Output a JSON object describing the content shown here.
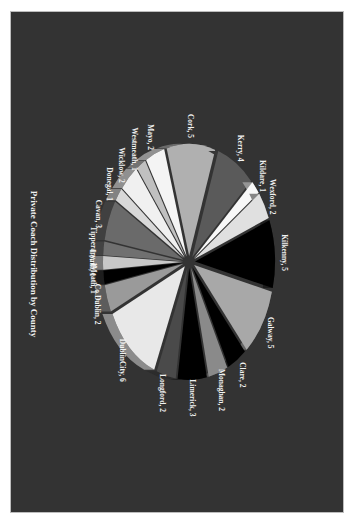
{
  "chart_data": {
    "type": "pie",
    "variant": "exploded 3D pie, rotated 90 degrees",
    "title": "Private Coach Distribution by County",
    "categories": [
      "Kilkenny",
      "Galway",
      "Clare",
      "Monaghan",
      "Limerick",
      "Longford",
      "DublinCity",
      "Co.Dublin",
      "Meath",
      "Louth",
      "Tipperary",
      "Cavan",
      "Donegal",
      "Wicklow",
      "Westmeath",
      "Mayo",
      "Cork",
      "Kerry",
      "Kildare",
      "Wexford"
    ],
    "values": [
      5,
      5,
      2,
      2,
      3,
      2,
      6,
      2,
      1,
      1,
      1,
      3,
      1,
      2,
      1,
      2,
      5,
      4,
      1,
      2
    ],
    "labels": [
      "Kilkenny, 5",
      "Galway, 5",
      "Clare, 2",
      "Monaghan, 2",
      "Limerick, 3",
      "Longford, 2",
      "DublinCity, 6",
      "Co.Dublin, 2",
      "Meath, 1",
      "Louth, 1",
      "Tipperary, 1",
      "Cavan, 3",
      "Donegal, 1",
      "Wicklow, 2",
      "Westmeath, 1",
      "Mayo, 2",
      "Cork, 5",
      "Kerry, 4",
      "Kildare, 1",
      "Wexford, 2"
    ],
    "colors": [
      "#000000",
      "#a8a8a8",
      "#000000",
      "#8a8a8a",
      "#000000",
      "#4a4a4a",
      "#e8e8e8",
      "#9a9a9a",
      "#000000",
      "#c8c8c8",
      "#707070",
      "#6a6a6a",
      "#d8d8d8",
      "#f0f0f0",
      "#c0c0c0",
      "#f4f4f4",
      "#b0b0b0",
      "#5a5a5a",
      "#f8f8f8",
      "#e0e0e0"
    ],
    "total": 51,
    "legend": "none (data labels on slices)",
    "background": "#333333"
  }
}
